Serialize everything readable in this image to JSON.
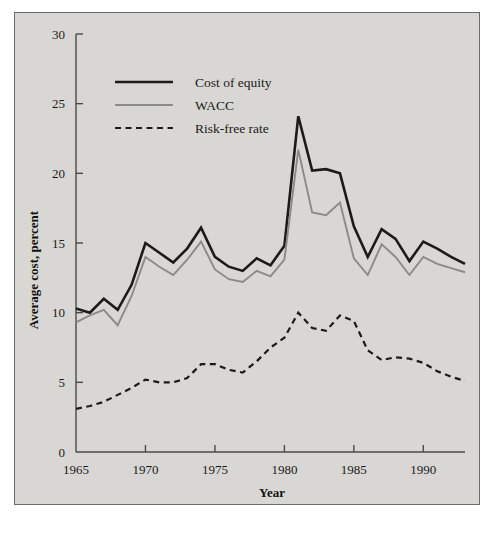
{
  "figure": {
    "background_color": "#ffffff",
    "panel_color": "#d9d7d3",
    "border_color": "#6b6b6b"
  },
  "chart_data": {
    "type": "line",
    "title": "",
    "xlabel": "Year",
    "ylabel": "Average cost, percent",
    "xlim": [
      1965,
      1993
    ],
    "ylim": [
      0,
      30
    ],
    "xticks": [
      1965,
      1970,
      1975,
      1980,
      1985,
      1990
    ],
    "xtick_labels": [
      "1965",
      "1970",
      "1975",
      "1980",
      "1985",
      "1990"
    ],
    "yticks": [
      0,
      5,
      10,
      15,
      20,
      25,
      30
    ],
    "ytick_labels": [
      "0",
      "5",
      "10",
      "15",
      "20",
      "25",
      "30"
    ],
    "grid": false,
    "legend_position": "upper-left-inside",
    "x": [
      1965,
      1966,
      1967,
      1968,
      1969,
      1970,
      1971,
      1972,
      1973,
      1974,
      1975,
      1976,
      1977,
      1978,
      1979,
      1980,
      1981,
      1982,
      1983,
      1984,
      1985,
      1986,
      1987,
      1988,
      1989,
      1990,
      1991,
      1992,
      1993
    ],
    "series": [
      {
        "name": "Cost of equity",
        "color": "#1b1b1b",
        "style": "solid",
        "width": 2.6,
        "values": [
          10.3,
          10.0,
          11.0,
          10.2,
          12.0,
          15.0,
          14.3,
          13.6,
          14.6,
          16.1,
          14.0,
          13.3,
          13.0,
          13.9,
          13.4,
          14.8,
          24.1,
          20.2,
          20.3,
          20.0,
          16.2,
          14.0,
          16.0,
          15.3,
          13.7,
          15.1,
          14.6,
          14.0,
          13.5
        ],
        "axis": "y"
      },
      {
        "name": "WACC",
        "color": "#8a8a8a",
        "style": "solid",
        "width": 1.9,
        "values": [
          9.3,
          9.8,
          10.2,
          9.1,
          11.2,
          14.0,
          13.3,
          12.7,
          13.8,
          15.1,
          13.1,
          12.4,
          12.2,
          13.0,
          12.6,
          13.8,
          21.7,
          17.2,
          17.0,
          17.9,
          13.9,
          12.7,
          14.9,
          14.0,
          12.7,
          14.0,
          13.5,
          13.2,
          12.9
        ],
        "axis": "y"
      },
      {
        "name": "Risk-free rate",
        "color": "#1b1b1b",
        "style": "dashed",
        "width": 2.2,
        "values": [
          3.1,
          3.3,
          3.6,
          4.1,
          4.6,
          5.2,
          5.0,
          5.0,
          5.3,
          6.3,
          6.3,
          5.9,
          5.7,
          6.5,
          7.5,
          8.2,
          10.0,
          8.9,
          8.7,
          9.8,
          9.4,
          7.3,
          6.6,
          6.8,
          6.7,
          6.4,
          5.8,
          5.4,
          5.1
        ],
        "axis": "y"
      }
    ]
  },
  "legend": {
    "items": [
      {
        "label": "Cost of equity",
        "style": "solid-thick"
      },
      {
        "label": "WACC",
        "style": "solid-thin-gray"
      },
      {
        "label": "Risk-free rate",
        "style": "dashed"
      }
    ]
  }
}
